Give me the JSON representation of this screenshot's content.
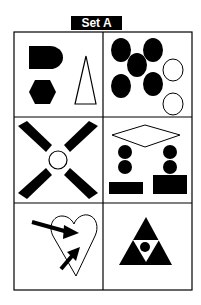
{
  "title": "Set A",
  "colors": {
    "ink": "#000000",
    "paper": "#ffffff"
  },
  "grid": {
    "rows": 3,
    "cols": 2
  },
  "panels": [
    {
      "id": "p1",
      "content": [
        "black D-shape",
        "black hexagon",
        "outlined tall triangle"
      ]
    },
    {
      "id": "p2",
      "content": [
        "five black ellipses",
        "two outlined ellipses"
      ]
    },
    {
      "id": "p3",
      "content": [
        "outlined circle",
        "four black diagonal blades"
      ]
    },
    {
      "id": "p4",
      "content": [
        "outlined diamond",
        "four black circles",
        "two black rectangles"
      ]
    },
    {
      "id": "p5",
      "content": [
        "outlined heart",
        "two black arrows"
      ]
    },
    {
      "id": "p6",
      "content": [
        "black triangle",
        "inverted white triangle",
        "black dot"
      ]
    }
  ]
}
